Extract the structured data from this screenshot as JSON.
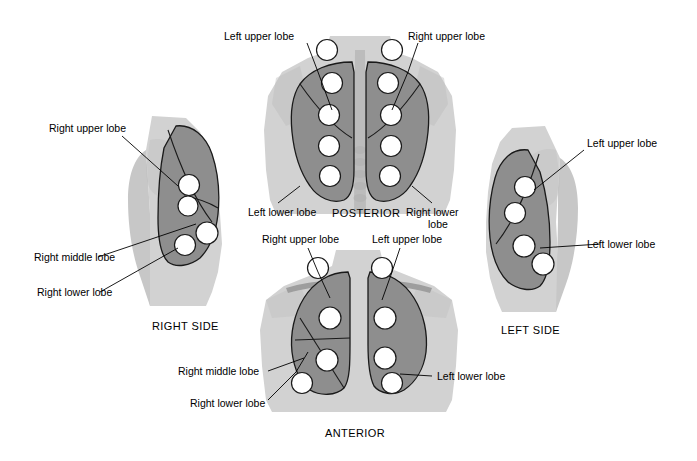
{
  "figure": {
    "colors": {
      "lung_fill": "#8e8e8e",
      "body_fill": "#d2d2d2",
      "point_fill": "#ffffff",
      "outline": "#1a1a1a",
      "text": "#000000"
    }
  },
  "views": {
    "posterior": {
      "caption": "POSTERIOR",
      "labels": {
        "left_upper": "Left upper lobe",
        "right_upper": "Right upper lobe",
        "left_lower": "Left lower lobe",
        "right_lower_line1": "Right lower",
        "right_lower_line2": "lobe"
      },
      "points_per_lung": 5
    },
    "anterior": {
      "caption": "ANTERIOR",
      "labels": {
        "right_upper": "Right upper lobe",
        "left_upper": "Left upper lobe",
        "right_middle": "Right middle lobe",
        "right_lower": "Right lower lobe",
        "left_lower": "Left lower lobe"
      },
      "points_per_lung": 4
    },
    "right_side": {
      "caption": "RIGHT SIDE",
      "labels": {
        "upper": "Right upper lobe",
        "middle": "Right middle lobe",
        "lower": "Right lower lobe"
      },
      "points": 4
    },
    "left_side": {
      "caption": "LEFT SIDE",
      "labels": {
        "upper": "Left upper lobe",
        "lower": "Left lower lobe"
      },
      "points": 4
    }
  }
}
